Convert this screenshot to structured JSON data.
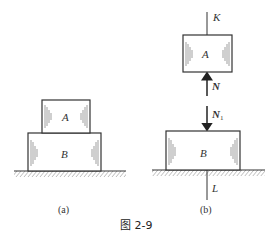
{
  "figure": {
    "caption": "图 2-9",
    "panels": [
      {
        "id": "a",
        "label": "(a)",
        "blocks": [
          {
            "name": "A",
            "label": "A"
          },
          {
            "name": "B",
            "label": "B"
          }
        ]
      },
      {
        "id": "b",
        "label": "(b)",
        "blocks": [
          {
            "name": "A",
            "label": "A"
          },
          {
            "name": "B",
            "label": "B"
          }
        ],
        "lines": {
          "top": "K",
          "bottom": "L"
        },
        "forces": [
          {
            "name": "N",
            "label": "N",
            "subscript": "",
            "direction": "up",
            "on": "A"
          },
          {
            "name": "N1",
            "label": "N",
            "subscript": "1",
            "direction": "down",
            "on": "B"
          }
        ]
      }
    ]
  },
  "colors": {
    "stroke": "#333333",
    "background": "#ffffff"
  }
}
